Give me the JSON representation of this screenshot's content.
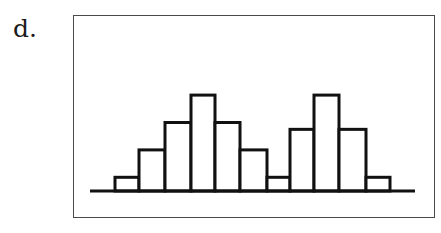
{
  "label": "d.",
  "chart_data": {
    "type": "bar",
    "subtype": "histogram",
    "title": "",
    "xlabel": "",
    "ylabel": "",
    "grid": false,
    "legend": null,
    "bimodal": true,
    "categories": [
      "1",
      "2",
      "3",
      "4",
      "5",
      "6",
      "7",
      "8",
      "9",
      "10",
      "11"
    ],
    "values": [
      1,
      3,
      5,
      7,
      5,
      3,
      1,
      4.5,
      7,
      4.5,
      1
    ],
    "ylim": [
      0,
      7
    ],
    "bar_fill": "#ffffff",
    "bar_stroke": "#111111"
  },
  "layout": {
    "baseline_y": 191,
    "baseline_x1": 90,
    "baseline_x2": 415,
    "bar_edges_x": [
      115,
      139,
      165,
      191,
      215,
      240,
      267,
      290,
      314,
      339,
      366,
      390
    ],
    "unit_px": 13.7
  }
}
